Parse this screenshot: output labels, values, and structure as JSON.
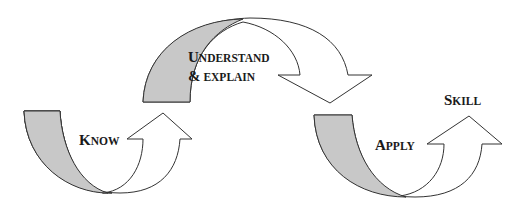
{
  "diagram": {
    "type": "process-flow",
    "colors": {
      "shaded_tail": "#c8c8c8",
      "arrow_fill": "#ffffff",
      "stroke": "#333333",
      "text": "#1a1a1a"
    },
    "stages": [
      {
        "id": "know",
        "label_first": "K",
        "label_rest": "NOW"
      },
      {
        "id": "understand",
        "line1_first": "U",
        "line1_rest": "NDERSTAND",
        "line2_first": "&",
        "line2_rest": " EXPLAIN"
      },
      {
        "id": "apply",
        "label_first": "A",
        "label_rest": "PPLY"
      },
      {
        "id": "skill",
        "label_first": "S",
        "label_rest": "KILL"
      }
    ],
    "flow": [
      "know",
      "understand",
      "apply",
      "skill"
    ]
  }
}
